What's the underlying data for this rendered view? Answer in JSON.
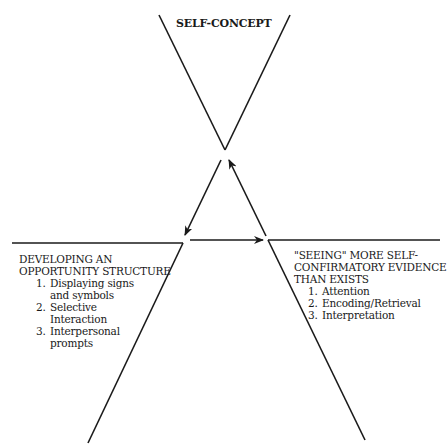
{
  "diagram": {
    "top_node": {
      "title": "SELF-CONCEPT"
    },
    "left_node": {
      "title_line1": "DEVELOPING AN",
      "title_line2": "OPPORTUNITY STRUCTURE",
      "items": [
        {
          "num": "1.",
          "text": "Displaying signs and symbols"
        },
        {
          "num": "2.",
          "text": "Selective Interaction"
        },
        {
          "num": "3.",
          "text": "Interpersonal prompts"
        }
      ]
    },
    "right_node": {
      "title_line1": "\"SEEING\" MORE SELF-",
      "title_line2": "CONFIRMATORY EVIDENCE",
      "title_line3": "THAN EXISTS",
      "items": [
        {
          "num": "1.",
          "text": "Attention"
        },
        {
          "num": "2.",
          "text": "Encoding/Retrieval"
        },
        {
          "num": "3.",
          "text": "Interpretation"
        }
      ]
    },
    "arrows": [
      {
        "from": "top_node",
        "to": "left_node"
      },
      {
        "from": "left_node",
        "to": "right_node"
      },
      {
        "from": "right_node",
        "to": "top_node"
      }
    ],
    "colors": {
      "line": "#1a1a1a",
      "background": "#ffffff"
    }
  }
}
